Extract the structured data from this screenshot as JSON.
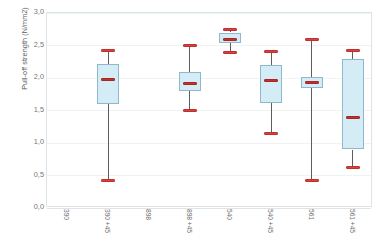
{
  "chart_data": {
    "type": "box",
    "title": "",
    "xlabel": "",
    "ylabel": "Pull-off strength (N/mm2)",
    "ylim": [
      0.0,
      3.0
    ],
    "ytick_labels": [
      "0,0",
      "0,5",
      "1,0",
      "1,5",
      "2,0",
      "2,5",
      "3,0"
    ],
    "ytick_values": [
      0.0,
      0.5,
      1.0,
      1.5,
      2.0,
      2.5,
      3.0
    ],
    "grid": true,
    "legend": "none",
    "categories": [
      "390",
      "390 +45",
      "898",
      "898 +45",
      "540",
      "540 +45",
      "561",
      "561 +45"
    ],
    "boxes": [
      {
        "category": "390",
        "has_data": false,
        "min": null,
        "q1": null,
        "median": null,
        "q3": null,
        "max": null
      },
      {
        "category": "390 +45",
        "has_data": true,
        "min": 0.42,
        "q1": 1.6,
        "median": 1.97,
        "q3": 2.21,
        "max": 2.42
      },
      {
        "category": "898",
        "has_data": false,
        "min": null,
        "q1": null,
        "median": null,
        "q3": null,
        "max": null
      },
      {
        "category": "898 +45",
        "has_data": true,
        "min": 1.5,
        "q1": 1.8,
        "median": 1.92,
        "q3": 2.1,
        "max": 2.5
      },
      {
        "category": "540",
        "has_data": true,
        "min": 2.4,
        "q1": 2.54,
        "median": 2.6,
        "q3": 2.7,
        "max": 2.74
      },
      {
        "category": "540 +45",
        "has_data": true,
        "min": 1.15,
        "q1": 1.62,
        "median": 1.96,
        "q3": 2.2,
        "max": 2.41
      },
      {
        "category": "561",
        "has_data": true,
        "min": 0.42,
        "q1": 1.84,
        "median": 1.93,
        "q3": 2.02,
        "max": 2.6
      },
      {
        "category": "561 +45",
        "has_data": true,
        "min": 0.62,
        "q1": 0.9,
        "median": 1.4,
        "q3": 2.29,
        "max": 2.43
      }
    ],
    "colors": {
      "box_fill": "#d3ecf5",
      "box_border": "#8fb8cb",
      "median": "#c9302c",
      "whisker": "#5d5d5d",
      "cap": "#d8413f",
      "grid": "#eef3f6",
      "axis": "#dbe5ea",
      "tick_text": "#777777",
      "label_text": "#5a5a5a"
    }
  }
}
